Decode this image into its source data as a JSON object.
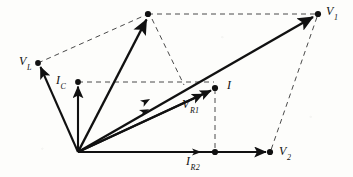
{
  "figure": {
    "type": "phasor-diagram",
    "canvas": {
      "width": 353,
      "height": 177
    },
    "background_color": "#fdfdfb",
    "line_color": "#111111",
    "dash_color": "#555555"
  },
  "origin": {
    "x": 78,
    "y": 152
  },
  "points": {
    "origin": {
      "x": 78,
      "y": 152,
      "dot": false,
      "label": ""
    },
    "V_L": {
      "x": 38,
      "y": 63,
      "dot": true,
      "label": "V",
      "sub": "L"
    },
    "I_C": {
      "x": 78,
      "y": 82,
      "dot": true,
      "label": "I",
      "sub": "C"
    },
    "apex": {
      "x": 148,
      "y": 14,
      "dot": true,
      "label": ""
    },
    "V_1": {
      "x": 318,
      "y": 14,
      "dot": true,
      "label": "V",
      "sub": "1"
    },
    "I": {
      "x": 215,
      "y": 88,
      "dot": true,
      "label": "I",
      "sub": ""
    },
    "V_R1": {
      "x": 182,
      "y": 101,
      "dot": false,
      "label": "V",
      "sub": "R1"
    },
    "I_R2": {
      "x": 215,
      "y": 152,
      "dot": true,
      "label": "I",
      "sub": "R2"
    },
    "V_2": {
      "x": 270,
      "y": 152,
      "dot": true,
      "label": "V",
      "sub": "2"
    },
    "junction": {
      "x": 182,
      "y": 83,
      "dot": false,
      "label": ""
    }
  },
  "labels": [
    {
      "id": "label-vl",
      "text": "V",
      "sub": "L",
      "x": 20,
      "y": 56
    },
    {
      "id": "label-ic",
      "text": "I",
      "sub": "C",
      "x": 57,
      "y": 76
    },
    {
      "id": "label-v1",
      "text": "V",
      "sub": "1",
      "x": 325,
      "y": 6
    },
    {
      "id": "label-i",
      "text": "I",
      "sub": "",
      "x": 226,
      "y": 80
    },
    {
      "id": "label-vr1",
      "text": "V",
      "sub": "R1",
      "x": 182,
      "y": 99
    },
    {
      "id": "label-ir2",
      "text": "I",
      "sub": "R2",
      "x": 185,
      "y": 156
    },
    {
      "id": "label-v2",
      "text": "V",
      "sub": "2",
      "x": 278,
      "y": 146
    }
  ],
  "solid_vectors": [
    {
      "id": "vector-vl",
      "name": "V_L vector",
      "from": "origin",
      "to": "V_L",
      "arrow": true,
      "width": 1.8
    },
    {
      "id": "vector-ic",
      "name": "I_C vector",
      "from": "origin",
      "to": "I_C",
      "arrow": true,
      "width": 1.8
    },
    {
      "id": "vector-apex",
      "name": "apex resultant",
      "from": "origin",
      "to": "apex",
      "arrow": true,
      "width": 2.2
    },
    {
      "id": "vector-v1",
      "name": "V_1 resultant",
      "from": "origin",
      "to": "V_1",
      "arrow": true,
      "width": 2.2
    },
    {
      "id": "vector-i",
      "name": "I current phasor",
      "from": "origin",
      "to": "I",
      "arrow": true,
      "width": 1.8
    },
    {
      "id": "vector-vr1",
      "name": "V_R1 phasor",
      "from": "origin",
      "to": "vr1end",
      "arrow": true,
      "width": 1.8
    },
    {
      "id": "vector-ir2",
      "name": "I_R2 horizontal axis",
      "from": "origin",
      "to": "V_2",
      "arrow": true,
      "width": 1.8
    }
  ],
  "solid_vector_endpoints": {
    "vr1end": {
      "x": 206,
      "y": 92
    }
  },
  "dashed_lines": [
    {
      "id": "dash-vl-apex",
      "name": "V_L to apex",
      "x1": 38,
      "y1": 63,
      "x2": 148,
      "y2": 14
    },
    {
      "id": "dash-apex-v1",
      "name": "apex to V_1",
      "x1": 148,
      "y1": 14,
      "x2": 318,
      "y2": 14
    },
    {
      "id": "dash-apex-j",
      "name": "apex to junction",
      "x1": 152,
      "y1": 18,
      "x2": 184,
      "y2": 85
    },
    {
      "id": "dash-ic-i",
      "name": "I_C to I horizontal",
      "x1": 78,
      "y1": 82,
      "x2": 215,
      "y2": 82
    },
    {
      "id": "dash-i-ir2",
      "name": "I down to I_R2",
      "x1": 215,
      "y1": 88,
      "x2": 215,
      "y2": 152
    },
    {
      "id": "dash-v1-v2",
      "name": "V_1 to V_2",
      "x1": 318,
      "y1": 14,
      "x2": 270,
      "y2": 152
    }
  ],
  "mid_arrows": [
    {
      "id": "mid-arrow-v1",
      "name": "arrowhead on V_1 vector",
      "x": 152,
      "y": 93,
      "angle": -27
    },
    {
      "id": "mid-arrow-i",
      "name": "arrowhead on I vector",
      "x": 150,
      "y": 103,
      "angle": -19
    },
    {
      "id": "mid-arrow-ir2",
      "name": "arrowhead on I_R2 axis",
      "x": 200,
      "y": 152,
      "angle": 0
    }
  ]
}
